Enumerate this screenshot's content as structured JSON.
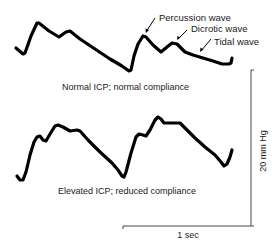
{
  "diagram": {
    "type": "ICP waveform comparison",
    "panels": [
      {
        "id": "normal",
        "caption": "Normal ICP; normal compliance",
        "annotations": [
          {
            "label": "Percussion wave"
          },
          {
            "label": "Dicrotic wave"
          },
          {
            "label": "Tidal wave"
          }
        ]
      },
      {
        "id": "elevated",
        "caption": "Elevated ICP; reduced compliance"
      }
    ],
    "scale_bar": {
      "vertical_label": "20 mm Hg",
      "horizontal_label": "1 sec"
    },
    "colors": {
      "waveform": "#000000",
      "text": "#1a1a1a",
      "scale_bar": "#333333",
      "background": "#ffffff"
    }
  }
}
